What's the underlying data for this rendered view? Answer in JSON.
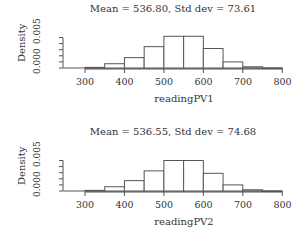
{
  "chart_data": [
    {
      "type": "bar",
      "title": "Mean =  536.80, Std dev =  73.61",
      "xlabel": "readingPV1",
      "ylabel": "Density",
      "bin_edges": [
        300,
        350,
        400,
        450,
        500,
        550,
        600,
        650,
        700,
        750,
        800
      ],
      "categories": [
        "300-350",
        "350-400",
        "400-450",
        "450-500",
        "500-550",
        "550-600",
        "600-650",
        "650-700",
        "700-750",
        "750-800"
      ],
      "values": [
        0.0001,
        0.0007,
        0.0017,
        0.0035,
        0.0052,
        0.0052,
        0.0032,
        0.001,
        0.0002,
        0.0
      ],
      "xticks": [
        300,
        400,
        500,
        600,
        700,
        800
      ],
      "yticks": [
        "0.000",
        "0.005"
      ],
      "xlim": [
        250,
        800
      ],
      "ylim": [
        0,
        0.0055
      ],
      "grid": false,
      "legend": null
    },
    {
      "type": "bar",
      "title": "Mean =  536.55, Std dev =  74.68",
      "xlabel": "readingPV2",
      "ylabel": "Density",
      "bin_edges": [
        300,
        350,
        400,
        450,
        500,
        550,
        600,
        650,
        700,
        750,
        800
      ],
      "categories": [
        "300-350",
        "350-400",
        "400-450",
        "450-500",
        "500-550",
        "550-600",
        "600-650",
        "650-700",
        "700-750",
        "750-800"
      ],
      "values": [
        0.0001,
        0.0007,
        0.0017,
        0.0033,
        0.005,
        0.005,
        0.0029,
        0.001,
        0.0002,
        0.0
      ],
      "xticks": [
        300,
        400,
        500,
        600,
        700,
        800
      ],
      "yticks": [
        "0.000",
        "0.005"
      ],
      "xlim": [
        250,
        800
      ],
      "ylim": [
        0,
        0.0055
      ],
      "grid": false,
      "legend": null
    }
  ],
  "panels": [
    {
      "title": "Mean =  536.80, Std dev =  73.61",
      "xlabel": "readingPV1",
      "ylabel": "Density",
      "ytick_low": "0.000",
      "ytick_high": "0.005",
      "xticks": [
        "300",
        "400",
        "500",
        "600",
        "700",
        "800"
      ]
    },
    {
      "title": "Mean =  536.55, Std dev =  74.68",
      "xlabel": "readingPV2",
      "ylabel": "Density",
      "ytick_low": "0.000",
      "ytick_high": "0.005",
      "xticks": [
        "300",
        "400",
        "500",
        "600",
        "700",
        "800"
      ]
    }
  ],
  "colors": {
    "bar_fill": "#ffffff",
    "bar_stroke": "#555555",
    "axis": "#555555",
    "text": "#333333"
  }
}
